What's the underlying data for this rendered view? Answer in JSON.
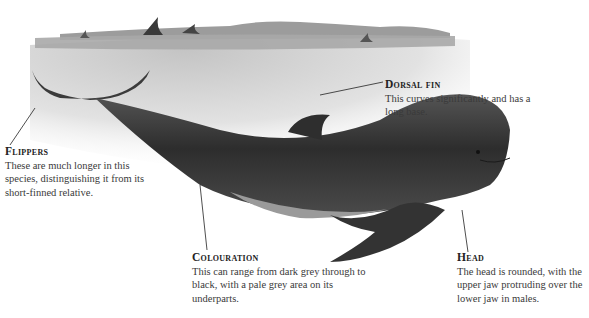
{
  "diagram": {
    "colors": {
      "background": "#ffffff",
      "water": "#cfcfcf",
      "whale_body": "#3a3a3a",
      "whale_belly": "#9a9a9a",
      "text": "#3a3a3a",
      "leader_line": "#222222"
    },
    "annotations": [
      {
        "id": "flippers",
        "title": "Flippers",
        "description": "These are much longer in this species, distinguishing it from its short-finned relative."
      },
      {
        "id": "dorsal-fin",
        "title": "Dorsal fin",
        "description": "This curves significantly and has a long base."
      },
      {
        "id": "colouration",
        "title": "Colouration",
        "description": "This can range from dark grey through to black, with a pale grey area on its underparts."
      },
      {
        "id": "head",
        "title": "Head",
        "description": "The head is rounded, with the upper jaw protruding over the lower jaw in males."
      }
    ]
  }
}
